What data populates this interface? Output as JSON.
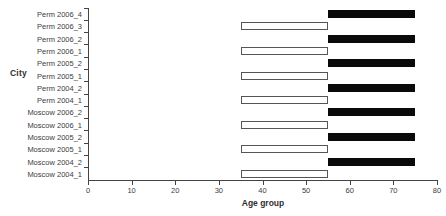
{
  "chart_data": {
    "type": "bar",
    "subtype": "horizontal-range-bar",
    "title": "",
    "xlabel": "Age group",
    "ylabel": "City",
    "xlim": [
      0,
      80
    ],
    "xticks": [
      0,
      10,
      20,
      30,
      40,
      50,
      60,
      70,
      80
    ],
    "grid": false,
    "legend": null,
    "categories": [
      "Perm 2006_4",
      "Perm 2006_3",
      "Perm 2006_2",
      "Perm 2006_1",
      "Perm 2005_2",
      "Perm 2005_1",
      "Perm 2004_2",
      "Perm 2004_1",
      "Moscow 2006_2",
      "Moscow 2006_1",
      "Moscow 2005_2",
      "Moscow 2005_1",
      "Moscow 2004_2",
      "Moscow 2004_1"
    ],
    "bars": [
      {
        "category": "Perm 2006_4",
        "start": 55,
        "end": 75,
        "style": "filled"
      },
      {
        "category": "Perm 2006_3",
        "start": 35,
        "end": 55,
        "style": "hollow"
      },
      {
        "category": "Perm 2006_2",
        "start": 55,
        "end": 75,
        "style": "filled"
      },
      {
        "category": "Perm 2006_1",
        "start": 35,
        "end": 55,
        "style": "hollow"
      },
      {
        "category": "Perm 2005_2",
        "start": 55,
        "end": 75,
        "style": "filled"
      },
      {
        "category": "Perm 2005_1",
        "start": 35,
        "end": 55,
        "style": "hollow"
      },
      {
        "category": "Perm 2004_2",
        "start": 55,
        "end": 75,
        "style": "filled"
      },
      {
        "category": "Perm 2004_1",
        "start": 35,
        "end": 55,
        "style": "hollow"
      },
      {
        "category": "Moscow 2006_2",
        "start": 55,
        "end": 75,
        "style": "filled"
      },
      {
        "category": "Moscow 2006_1",
        "start": 35,
        "end": 55,
        "style": "hollow"
      },
      {
        "category": "Moscow 2005_2",
        "start": 55,
        "end": 75,
        "style": "filled"
      },
      {
        "category": "Moscow 2005_1",
        "start": 35,
        "end": 55,
        "style": "hollow"
      },
      {
        "category": "Moscow 2004_2",
        "start": 55,
        "end": 75,
        "style": "filled"
      },
      {
        "category": "Moscow 2004_1",
        "start": 35,
        "end": 55,
        "style": "hollow"
      }
    ],
    "colors": {
      "filled_bar": "#0a0a0a",
      "hollow_bar_fill": "#ffffff",
      "hollow_bar_border": "#555555",
      "axis": "#444444",
      "text": "#3c3c3c",
      "background": "#ffffff"
    }
  }
}
